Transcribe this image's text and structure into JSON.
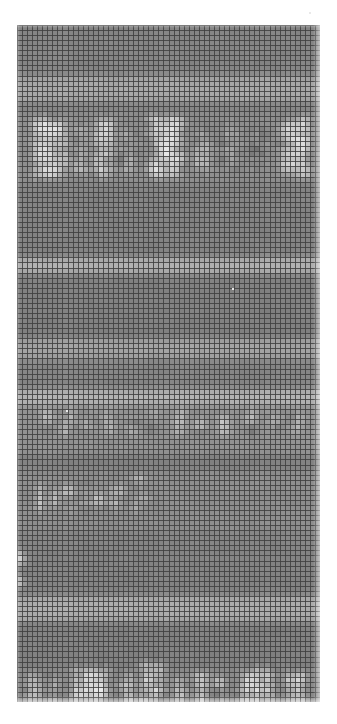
{
  "page": {
    "width": 337,
    "height": 724,
    "background_color": "#ffffff"
  },
  "mosaic": {
    "label": "pixelated-content",
    "left": 17,
    "top": 25,
    "width": 303,
    "height": 677,
    "cell_size": 5.05,
    "grid_line_color": "#3f3f3f",
    "grid_line_width": 1,
    "base_color": "#8d8d8d",
    "highlight_color": "#f2f2f2",
    "shadow_color": "#5c5c5c",
    "columns": 60,
    "rows": 134,
    "noise_seed": 20240517,
    "grid_visible": true
  },
  "content_bands": [
    {
      "name": "top-quiet-band",
      "row_start": 0,
      "row_end": 10,
      "kind": "flat",
      "level": 0.46,
      "blocks": []
    },
    {
      "name": "upper-light-strip",
      "row_start": 10,
      "row_end": 15,
      "kind": "strip",
      "level": 0.62,
      "blocks": []
    },
    {
      "name": "headline-row",
      "row_start": 17,
      "row_end": 31,
      "kind": "text",
      "level": 0.5,
      "glyph_brightness": 0.98,
      "glyph_rows": [
        {
          "top": 18,
          "height": 12,
          "runs": [
            [
              4,
              5
            ],
            [
              10,
              2
            ],
            [
              13,
              1
            ],
            [
              16,
              4
            ],
            [
              22,
              2
            ],
            [
              26,
              1
            ],
            [
              30,
              4
            ],
            [
              36,
              2
            ],
            [
              39,
              1
            ],
            [
              43,
              1
            ],
            [
              46,
              1
            ],
            [
              52,
              5
            ]
          ]
        }
      ],
      "blocks": [
        {
          "col": 3,
          "row": 18,
          "w": 7,
          "h": 12,
          "level": 0.93
        },
        {
          "col": 11,
          "row": 20,
          "w": 3,
          "h": 9,
          "level": 0.8
        },
        {
          "col": 15,
          "row": 18,
          "w": 4,
          "h": 12,
          "level": 0.86
        },
        {
          "col": 20,
          "row": 21,
          "w": 4,
          "h": 8,
          "level": 0.74
        },
        {
          "col": 26,
          "row": 18,
          "w": 7,
          "h": 12,
          "level": 0.95
        },
        {
          "col": 35,
          "row": 20,
          "w": 3,
          "h": 9,
          "level": 0.78
        },
        {
          "col": 40,
          "row": 19,
          "w": 4,
          "h": 10,
          "level": 0.72
        },
        {
          "col": 46,
          "row": 20,
          "w": 3,
          "h": 8,
          "level": 0.7
        },
        {
          "col": 52,
          "row": 18,
          "w": 6,
          "h": 12,
          "level": 0.92
        }
      ]
    },
    {
      "name": "mid-quiet-band",
      "row_start": 32,
      "row_end": 46,
      "kind": "flat",
      "level": 0.45,
      "blocks": []
    },
    {
      "name": "light-strip-a",
      "row_start": 46,
      "row_end": 49,
      "kind": "strip",
      "level": 0.66,
      "blocks": []
    },
    {
      "name": "body-band-1",
      "row_start": 49,
      "row_end": 62,
      "kind": "flat",
      "level": 0.44,
      "blocks": []
    },
    {
      "name": "light-strip-b",
      "row_start": 62,
      "row_end": 66,
      "kind": "strip",
      "level": 0.6,
      "blocks": []
    },
    {
      "name": "body-band-2",
      "row_start": 66,
      "row_end": 72,
      "kind": "flat",
      "level": 0.46,
      "blocks": []
    },
    {
      "name": "light-strip-c",
      "row_start": 72,
      "row_end": 75,
      "kind": "strip",
      "level": 0.68,
      "blocks": []
    },
    {
      "name": "subhead-text-row",
      "row_start": 75,
      "row_end": 85,
      "kind": "text",
      "level": 0.52,
      "glyph_brightness": 0.88,
      "blocks": [
        {
          "col": 5,
          "row": 76,
          "w": 2,
          "h": 5,
          "level": 0.9
        },
        {
          "col": 9,
          "row": 76,
          "w": 2,
          "h": 5,
          "level": 0.86
        },
        {
          "col": 13,
          "row": 76,
          "w": 2,
          "h": 5,
          "level": 0.84
        },
        {
          "col": 17,
          "row": 76,
          "w": 2,
          "h": 5,
          "level": 0.88
        },
        {
          "col": 22,
          "row": 76,
          "w": 2,
          "h": 5,
          "level": 0.86
        },
        {
          "col": 26,
          "row": 76,
          "w": 2,
          "h": 5,
          "level": 0.82
        },
        {
          "col": 31,
          "row": 76,
          "w": 2,
          "h": 5,
          "level": 0.88
        },
        {
          "col": 35,
          "row": 76,
          "w": 2,
          "h": 5,
          "level": 0.84
        },
        {
          "col": 40,
          "row": 76,
          "w": 2,
          "h": 5,
          "level": 0.86
        },
        {
          "col": 45,
          "row": 76,
          "w": 2,
          "h": 5,
          "level": 0.82
        },
        {
          "col": 50,
          "row": 76,
          "w": 2,
          "h": 5,
          "level": 0.88
        },
        {
          "col": 54,
          "row": 76,
          "w": 3,
          "h": 5,
          "level": 0.84
        }
      ]
    },
    {
      "name": "body-band-3",
      "row_start": 85,
      "row_end": 88,
      "kind": "flat",
      "level": 0.44,
      "blocks": []
    },
    {
      "name": "small-text-row",
      "row_start": 88,
      "row_end": 100,
      "kind": "text",
      "level": 0.5,
      "glyph_brightness": 0.95,
      "blocks": [
        {
          "col": 4,
          "row": 90,
          "w": 1,
          "h": 6,
          "level": 0.95
        },
        {
          "col": 5,
          "row": 93,
          "w": 2,
          "h": 2,
          "level": 0.92
        },
        {
          "col": 7,
          "row": 92,
          "w": 1,
          "h": 4,
          "level": 0.9
        },
        {
          "col": 9,
          "row": 91,
          "w": 2,
          "h": 2,
          "level": 0.93
        },
        {
          "col": 10,
          "row": 94,
          "w": 2,
          "h": 2,
          "level": 0.9
        },
        {
          "col": 13,
          "row": 90,
          "w": 1,
          "h": 6,
          "level": 0.94
        },
        {
          "col": 15,
          "row": 92,
          "w": 2,
          "h": 3,
          "level": 0.92
        },
        {
          "col": 18,
          "row": 91,
          "w": 3,
          "h": 2,
          "level": 0.95
        },
        {
          "col": 18,
          "row": 94,
          "w": 3,
          "h": 2,
          "level": 0.92
        },
        {
          "col": 23,
          "row": 89,
          "w": 2,
          "h": 2,
          "level": 0.95
        },
        {
          "col": 24,
          "row": 92,
          "w": 2,
          "h": 2,
          "level": 0.9
        },
        {
          "col": 23,
          "row": 94,
          "w": 1,
          "h": 2,
          "level": 0.88
        }
      ]
    },
    {
      "name": "gap-band",
      "row_start": 100,
      "row_end": 103,
      "kind": "flat",
      "level": 0.46,
      "blocks": []
    },
    {
      "name": "left-marker-band",
      "row_start": 103,
      "row_end": 112,
      "kind": "flat",
      "level": 0.45,
      "blocks": [
        {
          "col": 0,
          "row": 104,
          "w": 2,
          "h": 3,
          "level": 0.95
        },
        {
          "col": 0,
          "row": 108,
          "w": 2,
          "h": 3,
          "level": 0.93
        }
      ]
    },
    {
      "name": "light-strip-d",
      "row_start": 113,
      "row_end": 118,
      "kind": "strip",
      "level": 0.64,
      "blocks": []
    },
    {
      "name": "lower-quiet-band",
      "row_start": 118,
      "row_end": 127,
      "kind": "flat",
      "level": 0.44,
      "blocks": []
    },
    {
      "name": "bottom-blocks-row",
      "row_start": 127,
      "row_end": 134,
      "kind": "text",
      "level": 0.48,
      "glyph_brightness": 0.97,
      "blocks": [
        {
          "col": 2,
          "row": 128,
          "w": 3,
          "h": 6,
          "level": 0.9
        },
        {
          "col": 6,
          "row": 129,
          "w": 2,
          "h": 5,
          "level": 0.86
        },
        {
          "col": 10,
          "row": 127,
          "w": 8,
          "h": 7,
          "level": 0.96
        },
        {
          "col": 20,
          "row": 128,
          "w": 3,
          "h": 6,
          "level": 0.84
        },
        {
          "col": 24,
          "row": 126,
          "w": 5,
          "h": 8,
          "level": 0.95
        },
        {
          "col": 31,
          "row": 129,
          "w": 3,
          "h": 5,
          "level": 0.82
        },
        {
          "col": 35,
          "row": 128,
          "w": 3,
          "h": 6,
          "level": 0.9
        },
        {
          "col": 39,
          "row": 129,
          "w": 2,
          "h": 5,
          "level": 0.84
        },
        {
          "col": 44,
          "row": 127,
          "w": 7,
          "h": 7,
          "level": 0.94
        },
        {
          "col": 53,
          "row": 128,
          "w": 4,
          "h": 6,
          "level": 0.88
        }
      ]
    }
  ],
  "artifacts": {
    "specks": [
      {
        "x": 309,
        "y": 12
      },
      {
        "x": 66,
        "y": 410
      },
      {
        "x": 232,
        "y": 288
      }
    ]
  },
  "accessibility": {
    "alt_text": "Heavily pixelated grayscale screenshot; all text is obscured by a mosaic grid"
  }
}
